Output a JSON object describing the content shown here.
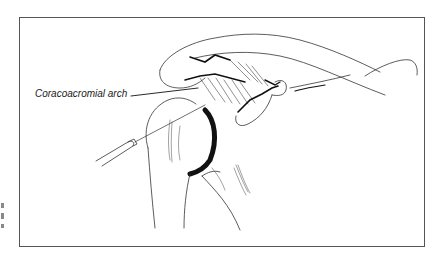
{
  "figure": {
    "label": "Coracoacromial arch",
    "colors": {
      "line": "#333333",
      "frame": "#555555",
      "shade": "#111111"
    }
  }
}
